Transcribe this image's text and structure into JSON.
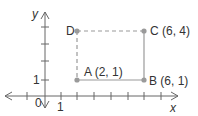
{
  "axes": {
    "x_label": "x",
    "y_label": "y",
    "origin_label": "0",
    "x_tick_label": "1",
    "y_tick_label": "1"
  },
  "points": [
    {
      "name": "A",
      "label": "A (2, 1)",
      "x": 2,
      "y": 1
    },
    {
      "name": "B",
      "label": "B (6, 1)",
      "x": 6,
      "y": 1
    },
    {
      "name": "C",
      "label": "C (6, 4)",
      "x": 6,
      "y": 4
    },
    {
      "name": "D",
      "label": "D",
      "x": 2,
      "y": 4
    }
  ],
  "segments": [
    {
      "from": "A",
      "to": "B",
      "style": "solid"
    },
    {
      "from": "B",
      "to": "C",
      "style": "solid"
    },
    {
      "from": "C",
      "to": "D",
      "style": "dashed"
    },
    {
      "from": "D",
      "to": "A",
      "style": "dashed"
    }
  ],
  "colors": {
    "axis": "#555555",
    "shape": "#999999",
    "point": "#999999",
    "text": "#333333"
  }
}
